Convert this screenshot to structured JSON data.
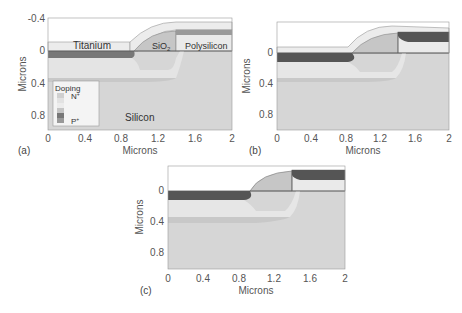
{
  "figure": {
    "panels": [
      {
        "id": "a",
        "tag": "(a)",
        "xlabel": "Microns",
        "ylabel": "Microns",
        "x_ticks": [
          "0",
          "0.4",
          "0.8",
          "1.2",
          "1.6",
          "2"
        ],
        "y_ticks": [
          "-0.4",
          "0",
          "0.4",
          "0.8"
        ],
        "region_labels": {
          "titanium": "Titanium",
          "sio2": "SiO",
          "sio2_sub": "2",
          "polysilicon": "Polysilicon",
          "silicon": "Silicon"
        },
        "legend": {
          "title": "Doping",
          "top_label": "N",
          "top_sup": "+",
          "bottom_label": "P",
          "bottom_sup": "+"
        }
      },
      {
        "id": "b",
        "tag": "(b)",
        "xlabel": "Microns",
        "ylabel": "Microns",
        "x_ticks": [
          "0",
          "0.4",
          "0.8",
          "1.2",
          "1.6",
          "2"
        ],
        "y_ticks": [
          "0",
          "0.4",
          "0.8"
        ]
      },
      {
        "id": "c",
        "tag": "(c)",
        "xlabel": "Microns",
        "ylabel": "Microns",
        "x_ticks": [
          "0",
          "0.4",
          "0.8",
          "1.2",
          "1.6",
          "2"
        ],
        "y_ticks": [
          "0",
          "0.4",
          "0.8"
        ]
      }
    ],
    "colors": {
      "silicon": "#d4d4d4",
      "light_doping": "#e6e6e6",
      "dark_doping": "#555555",
      "titanium": "#ececec",
      "sio2": "#c4c4c4",
      "polysilicon": "#e9e9e9",
      "outline": "#777777"
    }
  }
}
